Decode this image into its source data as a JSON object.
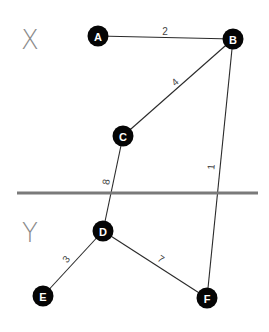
{
  "diagram": {
    "type": "weighted-graph",
    "regions": [
      {
        "id": "X",
        "label": "X",
        "x": 30,
        "y": 40
      },
      {
        "id": "Y",
        "label": "Y",
        "x": 30,
        "y": 233
      }
    ],
    "divider": {
      "x1": 17,
      "y1": 193,
      "x2": 258,
      "y2": 193,
      "color": "#7a7a7a"
    },
    "nodes": [
      {
        "id": "A",
        "label": "A",
        "x": 98,
        "y": 36
      },
      {
        "id": "B",
        "label": "B",
        "x": 233,
        "y": 39
      },
      {
        "id": "C",
        "label": "C",
        "x": 123,
        "y": 136
      },
      {
        "id": "D",
        "label": "D",
        "x": 103,
        "y": 231
      },
      {
        "id": "E",
        "label": "E",
        "x": 43,
        "y": 296
      },
      {
        "id": "F",
        "label": "F",
        "x": 207,
        "y": 298
      }
    ],
    "edges": [
      {
        "from": "A",
        "to": "B",
        "weight": "2",
        "label_x": 165,
        "label_y": 31,
        "rotate": 0
      },
      {
        "from": "B",
        "to": "C",
        "weight": "4",
        "label_x": 175,
        "label_y": 82,
        "rotate": -42
      },
      {
        "from": "B",
        "to": "F",
        "weight": "1",
        "label_x": 211,
        "label_y": 167,
        "rotate": -85
      },
      {
        "from": "C",
        "to": "D",
        "weight": "8",
        "label_x": 106,
        "label_y": 182,
        "rotate": -80
      },
      {
        "from": "D",
        "to": "E",
        "weight": "3",
        "label_x": 66,
        "label_y": 259,
        "rotate": -50
      },
      {
        "from": "D",
        "to": "F",
        "weight": "7",
        "label_x": 161,
        "label_y": 259,
        "rotate": 34
      }
    ],
    "colors": {
      "node_fill": "#050505",
      "node_text": "#ffffff",
      "edge": "#2a2a2a",
      "region_label": "#8a8a8a"
    }
  }
}
